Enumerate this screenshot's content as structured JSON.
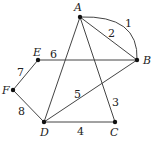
{
  "graph": {
    "nodes": [
      {
        "id": "A",
        "label": "A",
        "x": 80,
        "y": 17,
        "lx": 74,
        "ly": 2
      },
      {
        "id": "B",
        "label": "B",
        "x": 137,
        "y": 60,
        "lx": 143,
        "ly": 55
      },
      {
        "id": "C",
        "label": "C",
        "x": 115,
        "y": 122,
        "lx": 110,
        "ly": 127
      },
      {
        "id": "D",
        "label": "D",
        "x": 44,
        "y": 122,
        "lx": 40,
        "ly": 127
      },
      {
        "id": "E",
        "label": "E",
        "x": 38,
        "y": 60,
        "lx": 33,
        "ly": 47
      },
      {
        "id": "F",
        "label": "F",
        "x": 13,
        "y": 90,
        "lx": 2,
        "ly": 85
      }
    ],
    "edges": [
      {
        "id": "1",
        "label": "1",
        "from": "A",
        "to": "B",
        "curved": true,
        "lx": 125,
        "ly": 18
      },
      {
        "id": "2",
        "label": "2",
        "from": "A",
        "to": "B",
        "curved": false,
        "lx": 108,
        "ly": 28
      },
      {
        "id": "3",
        "label": "3",
        "from": "A",
        "to": "C",
        "curved": false,
        "lx": 112,
        "ly": 97
      },
      {
        "id": "4",
        "label": "4",
        "from": "D",
        "to": "C",
        "curved": false,
        "lx": 77,
        "ly": 126
      },
      {
        "id": "5",
        "label": "5",
        "from": "D",
        "to": "B",
        "curved": false,
        "lx": 74,
        "ly": 89
      },
      {
        "id": "6",
        "label": "6",
        "from": "E",
        "to": "B",
        "curved": false,
        "lx": 50,
        "ly": 49
      },
      {
        "id": "7",
        "label": "7",
        "from": "E",
        "to": "F",
        "curved": false,
        "lx": 17,
        "ly": 67
      },
      {
        "id": "8",
        "label": "8",
        "from": "F",
        "to": "D",
        "curved": false,
        "lx": 18,
        "ly": 106
      },
      {
        "id": "AD",
        "label": "",
        "from": "A",
        "to": "D",
        "curved": false
      }
    ]
  },
  "colors": {
    "line": "#444444",
    "node": "#111111"
  }
}
